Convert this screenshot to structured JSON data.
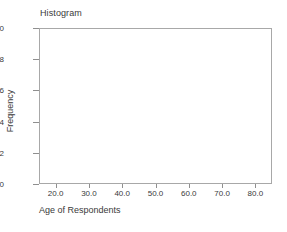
{
  "chart_data": {
    "type": "bar",
    "title": "Histogram",
    "subtitle": "",
    "xlabel": "Age of Respondents",
    "ylabel": "Frequency",
    "xlim": [
      15.0,
      85.0
    ],
    "ylim": [
      0,
      10
    ],
    "x_ticks": [
      20.0,
      30.0,
      40.0,
      50.0,
      60.0,
      70.0,
      80.0
    ],
    "x_tick_labels": [
      "20.0",
      "30.0",
      "40.0",
      "50.0",
      "60.0",
      "70.0",
      "80.0"
    ],
    "y_ticks": [
      0,
      2,
      4,
      6,
      8,
      10
    ],
    "y_tick_labels": [
      "0",
      "2",
      "4",
      "6",
      "8",
      "10"
    ],
    "grid": false,
    "legend": false,
    "legend_position": "none",
    "categories": [],
    "values": [],
    "annotations": [],
    "axis_color": "#a8a8a8",
    "tick_color": "#8f8f8f",
    "text_color": "#3a3a3a",
    "background_color": "#ffffff",
    "bar_color": "#7f7f7f"
  }
}
